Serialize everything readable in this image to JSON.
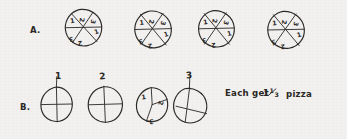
{
  "document": {
    "kind": "handwritten-math-worksheet",
    "background_color": "#f2f1ef",
    "ink_color": "#2c2a28"
  },
  "rows": [
    {
      "id": "row-a",
      "label": "A.",
      "circles": [
        {
          "id": "a-circle-1",
          "slices": 6,
          "slice_labels": [
            "1",
            "2",
            "3",
            "1",
            "2",
            "3"
          ],
          "top_label": ""
        },
        {
          "id": "a-circle-2",
          "slices": 6,
          "slice_labels": [
            "1",
            "2",
            "3",
            "1",
            "2",
            "3"
          ],
          "top_label": ""
        },
        {
          "id": "a-circle-3",
          "slices": 6,
          "slice_labels": [
            "1",
            "2",
            "3",
            "1",
            "2",
            "3"
          ],
          "top_label": ""
        },
        {
          "id": "a-circle-4",
          "slices": 6,
          "slice_labels": [
            "1",
            "2",
            "3",
            "1",
            "2",
            "3"
          ],
          "top_label": ""
        }
      ]
    },
    {
      "id": "row-b",
      "label": "B.",
      "circles": [
        {
          "id": "b-circle-1",
          "slices": 4,
          "slice_labels": [
            "",
            "",
            "",
            ""
          ],
          "top_label": "1"
        },
        {
          "id": "b-circle-2",
          "slices": 4,
          "slice_labels": [
            "",
            "",
            "",
            ""
          ],
          "top_label": "2"
        },
        {
          "id": "b-circle-3",
          "slices": 3,
          "slice_labels": [
            "1",
            "2",
            "3"
          ],
          "top_label": ""
        },
        {
          "id": "b-circle-4",
          "slices": 4,
          "slice_labels": [
            "",
            "",
            "",
            ""
          ],
          "top_label": "3"
        }
      ]
    }
  ],
  "note": {
    "prefix": "Each get",
    "whole": "1",
    "numerator": "1",
    "denominator": "3",
    "fraction": "1/3",
    "suffix": "pizza",
    "full_text": "Each get 1 1/3 pizza"
  }
}
